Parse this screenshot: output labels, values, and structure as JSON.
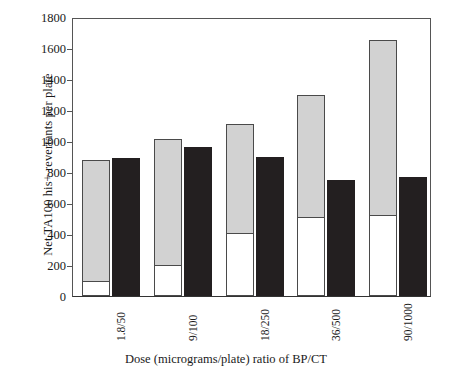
{
  "chart_data": {
    "type": "bar",
    "title": "",
    "xlabel": "Dose (micrograms/plate) ratio of BP/CT",
    "ylabel": "Net TA100 his+ revertants per plate",
    "categories": [
      "1.8/50",
      "9/100",
      "18/250",
      "36/500",
      "90/1000"
    ],
    "ylim": [
      0,
      1800
    ],
    "yticks": [
      0,
      200,
      400,
      600,
      800,
      1000,
      1200,
      1400,
      1600,
      1800
    ],
    "grid": false,
    "legend": "none",
    "series": [
      {
        "name": "stacked-bar-lower-white",
        "style": "white-fill",
        "values": [
          100,
          200,
          405,
          510,
          525
        ]
      },
      {
        "name": "stacked-bar-upper-gray",
        "style": "gray-fill",
        "values": [
          880,
          1010,
          1110,
          1300,
          1650
        ]
      },
      {
        "name": "solid-black-bar",
        "style": "black-fill",
        "values": [
          890,
          960,
          900,
          750,
          770
        ]
      }
    ],
    "colors": {
      "gray": "#d2d2d2",
      "white": "#ffffff",
      "black": "#231f20",
      "axis": "#555555",
      "text": "#1a1a1a"
    }
  }
}
